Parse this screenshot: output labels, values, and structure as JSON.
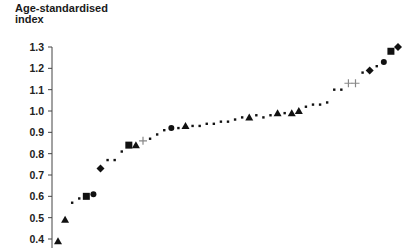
{
  "chart_data": {
    "type": "scatter",
    "title": "",
    "xlabel": "",
    "ylabel": "Age-standardised index",
    "ylim": [
      0.4,
      1.3
    ],
    "yticks": [
      "1.3",
      "1.2",
      "1.1",
      "1.0",
      "0.9",
      "0.8",
      "0.7",
      "0.6",
      "0.5",
      "0.4"
    ],
    "grid": false,
    "legend": "none",
    "x": [
      1,
      2,
      3,
      4,
      5,
      6,
      7,
      8,
      9,
      10,
      11,
      12,
      13,
      14,
      15,
      16,
      17,
      18,
      19,
      20,
      21,
      22,
      23,
      24,
      25,
      26,
      27,
      28,
      29,
      30,
      31,
      32,
      33,
      34,
      35,
      36,
      37,
      38,
      39,
      40,
      41,
      42,
      43,
      44,
      45,
      46,
      47,
      48,
      49
    ],
    "values": [
      0.39,
      0.49,
      0.57,
      0.59,
      0.6,
      0.61,
      0.73,
      0.77,
      0.77,
      0.81,
      0.84,
      0.84,
      0.86,
      0.87,
      0.89,
      0.91,
      0.92,
      0.92,
      0.93,
      0.93,
      0.93,
      0.94,
      0.94,
      0.95,
      0.95,
      0.96,
      0.97,
      0.97,
      0.98,
      0.97,
      0.98,
      0.99,
      0.99,
      0.99,
      1.0,
      1.02,
      1.03,
      1.03,
      1.04,
      1.1,
      1.1,
      1.13,
      1.13,
      1.18,
      1.19,
      1.21,
      1.23,
      1.28,
      1.3
    ],
    "markers": [
      "triangle",
      "triangle",
      "dot",
      "dot",
      "square",
      "circle",
      "diamond",
      "dot",
      "dot",
      "dot",
      "square",
      "triangle",
      "plus",
      "dot",
      "dot",
      "dot",
      "circle",
      "dot",
      "triangle",
      "dot",
      "dot",
      "dot",
      "dot",
      "dot",
      "dot",
      "dot",
      "dot",
      "triangle",
      "dot",
      "dot",
      "dot",
      "triangle",
      "dot",
      "triangle",
      "triangle",
      "dot",
      "dot",
      "dot",
      "dot",
      "dot",
      "dot",
      "plus",
      "plus",
      "dot",
      "diamond",
      "dot",
      "circle",
      "square",
      "diamond"
    ]
  },
  "labels": {
    "ylabel_line1": "Age-standardised",
    "ylabel_line2": "index"
  },
  "colors": {
    "marker": "#111111",
    "plus": "#888888",
    "axis": "#444444"
  }
}
